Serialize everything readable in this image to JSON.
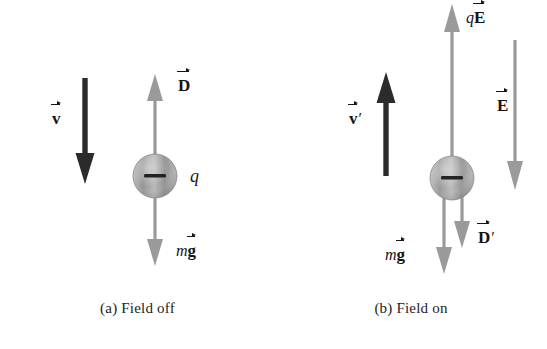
{
  "figure": {
    "background": "#ffffff",
    "arrow_gray": "#9a9a9a",
    "arrow_dark": "#2b2b2b",
    "sphere_gray": "#a8a8a8"
  },
  "panels": [
    {
      "id": "a",
      "caption": "(a) Field off",
      "charge_label": "q",
      "charge_sign": "−",
      "vectors": [
        {
          "name": "velocity",
          "symbol": "v",
          "prime": "",
          "prefix": "",
          "label": "v⃗",
          "direction": "down",
          "color": "#2b2b2b",
          "style": "thick-black"
        },
        {
          "name": "drag",
          "symbol": "D",
          "prime": "",
          "prefix": "",
          "label": "D⃗",
          "direction": "up",
          "color": "#9a9a9a",
          "style": "thin-gray"
        },
        {
          "name": "weight",
          "symbol": "g",
          "prime": "",
          "prefix": "m",
          "label": "mg⃗",
          "direction": "down",
          "color": "#9a9a9a",
          "style": "thin-gray"
        }
      ]
    },
    {
      "id": "b",
      "caption": "(b) Field on",
      "charge_label": "",
      "charge_sign": "−",
      "vectors": [
        {
          "name": "electric-force",
          "symbol": "E",
          "prime": "",
          "prefix": "q",
          "label": "qE⃗",
          "direction": "up",
          "color": "#9a9a9a",
          "style": "thin-gray"
        },
        {
          "name": "velocity",
          "symbol": "v",
          "prime": "′",
          "prefix": "",
          "label": "v⃗′",
          "direction": "up",
          "color": "#2b2b2b",
          "style": "thick-black"
        },
        {
          "name": "weight",
          "symbol": "g",
          "prime": "",
          "prefix": "m",
          "label": "mg⃗",
          "direction": "down",
          "color": "#9a9a9a",
          "style": "thin-gray"
        },
        {
          "name": "drag",
          "symbol": "D",
          "prime": "′",
          "prefix": "",
          "label": "D⃗′",
          "direction": "down",
          "color": "#9a9a9a",
          "style": "thin-gray"
        },
        {
          "name": "electric-field",
          "symbol": "E",
          "prime": "",
          "prefix": "",
          "label": "E⃗",
          "direction": "down",
          "color": "#9a9a9a",
          "style": "thin-gray"
        }
      ]
    }
  ],
  "labels": {
    "a_velocity_prefix": "",
    "a_velocity_symbol": "v",
    "a_velocity_prime": "",
    "a_drag_prefix": "",
    "a_drag_symbol": "D",
    "a_drag_prime": "",
    "a_weight_prefix": "m",
    "a_weight_symbol": "g",
    "a_weight_prime": "",
    "a_charge": "q",
    "a_sign": "−",
    "b_eforce_prefix": "q",
    "b_eforce_symbol": "E",
    "b_eforce_prime": "",
    "b_velocity_prefix": "",
    "b_velocity_symbol": "v",
    "b_velocity_prime": "′",
    "b_weight_prefix": "m",
    "b_weight_symbol": "g",
    "b_weight_prime": "",
    "b_drag_prefix": "",
    "b_drag_symbol": "D",
    "b_drag_prime": "′",
    "b_efield_prefix": "",
    "b_efield_symbol": "E",
    "b_efield_prime": "",
    "b_sign": "−"
  }
}
